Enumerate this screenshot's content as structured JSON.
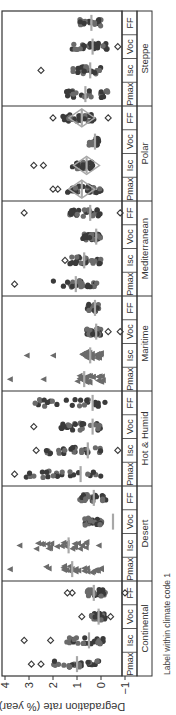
{
  "chart_data": {
    "type": "scatter",
    "title": "",
    "ylabel": "Degradation rate (% year)",
    "xlabel": "Label within climate code 1",
    "ylim": [
      -1,
      4
    ],
    "yticks": [
      -1,
      0,
      1,
      2,
      3,
      4
    ],
    "parameters": [
      "Pmax",
      "Isc",
      "Voc",
      "FF"
    ],
    "climates": [
      "Continental",
      "Desert",
      "Hot & Humid",
      "Maritime",
      "Mediterranean",
      "Polar",
      "Steppe"
    ],
    "groups": [
      {
        "climate": "Continental",
        "param": "Pmax",
        "median": 1.0,
        "range": [
          0.0,
          2.0
        ],
        "outliers": [
          2.5,
          2.9
        ]
      },
      {
        "climate": "Continental",
        "param": "Isc",
        "median": 0.5,
        "range": [
          -0.1,
          1.6
        ],
        "outliers": [
          2.1,
          3.2
        ]
      },
      {
        "climate": "Continental",
        "param": "Voc",
        "median": 0.1,
        "range": [
          -0.2,
          0.4
        ],
        "outliers": [
          -0.4,
          0.8
        ]
      },
      {
        "climate": "Continental",
        "param": "FF",
        "median": 0.3,
        "range": [
          -0.2,
          0.6
        ],
        "outliers": [
          1.2,
          1.4,
          -1.0
        ]
      },
      {
        "climate": "Desert",
        "param": "Pmax",
        "median": 1.2,
        "range": [
          0.0,
          2.3
        ],
        "outliers": [
          3.8
        ]
      },
      {
        "climate": "Desert",
        "param": "Isc",
        "median": 1.35,
        "range": [
          0.6,
          2.7
        ],
        "outliers": [
          3.4,
          0.1
        ]
      },
      {
        "climate": "Desert",
        "param": "Voc",
        "median": -0.5,
        "range": [
          -0.1,
          0.7
        ],
        "outliers": []
      },
      {
        "climate": "Desert",
        "param": "FF",
        "median": 0.3,
        "range": [
          -0.2,
          0.9
        ],
        "outliers": []
      },
      {
        "climate": "Hot & Humid",
        "param": "Pmax",
        "median": 0.85,
        "range": [
          0.0,
          3.2
        ],
        "outliers": [
          3.6
        ]
      },
      {
        "climate": "Hot & Humid",
        "param": "Isc",
        "median": 0.55,
        "range": [
          0.0,
          2.3
        ],
        "outliers": [
          2.7,
          -0.7
        ]
      },
      {
        "climate": "Hot & Humid",
        "param": "Voc",
        "median": 0.35,
        "range": [
          0.0,
          1.7
        ],
        "outliers": [
          2.8
        ]
      },
      {
        "climate": "Hot & Humid",
        "param": "FF",
        "median": 0.35,
        "range": [
          -0.2,
          2.8
        ],
        "outliers": []
      },
      {
        "climate": "Maritime",
        "param": "Pmax",
        "median": 0.7,
        "range": [
          -0.1,
          1.1
        ],
        "outliers": [
          2.4,
          3.8
        ]
      },
      {
        "climate": "Maritime",
        "param": "Isc",
        "median": 0.45,
        "range": [
          0.0,
          0.8
        ],
        "outliers": [
          2.0,
          3.1
        ]
      },
      {
        "climate": "Maritime",
        "param": "Voc",
        "median": 0.2,
        "range": [
          0.0,
          0.6
        ],
        "outliers": [
          -0.3,
          -0.8
        ]
      },
      {
        "climate": "Maritime",
        "param": "FF",
        "median": 0.25,
        "range": [
          0.1,
          0.6
        ],
        "outliers": []
      },
      {
        "climate": "Mediterranean",
        "param": "Pmax",
        "median": 1.05,
        "range": [
          0.0,
          2.0
        ],
        "outliers": [
          3.6
        ]
      },
      {
        "climate": "Mediterranean",
        "param": "Isc",
        "median": 0.7,
        "range": [
          0.0,
          1.3
        ],
        "outliers": [
          1.5
        ]
      },
      {
        "climate": "Mediterranean",
        "param": "Voc",
        "median": 0.2,
        "range": [
          0.0,
          0.8
        ],
        "outliers": []
      },
      {
        "climate": "Mediterranean",
        "param": "FF",
        "median": 0.45,
        "range": [
          0.0,
          1.3
        ],
        "outliers": [
          3.2,
          -0.8
        ]
      },
      {
        "climate": "Polar",
        "param": "Pmax",
        "median": 0.8,
        "range": [
          0.0,
          1.5
        ],
        "outliers": [
          1.8,
          2.0
        ]
      },
      {
        "climate": "Polar",
        "param": "Isc",
        "median": 0.6,
        "range": [
          0.3,
          1.2
        ],
        "outliers": [
          2.4,
          2.8
        ]
      },
      {
        "climate": "Polar",
        "param": "Voc",
        "median": 0.25,
        "range": [
          0.1,
          0.5
        ],
        "outliers": []
      },
      {
        "climate": "Polar",
        "param": "FF",
        "median": 0.8,
        "range": [
          0.1,
          1.6
        ],
        "outliers": [
          2.0,
          -0.3
        ]
      },
      {
        "climate": "Steppe",
        "param": "Pmax",
        "median": 0.65,
        "range": [
          -0.3,
          1.5
        ],
        "outliers": []
      },
      {
        "climate": "Steppe",
        "param": "Isc",
        "median": 0.45,
        "range": [
          0.0,
          1.2
        ],
        "outliers": [
          2.5
        ]
      },
      {
        "climate": "Steppe",
        "param": "Voc",
        "median": 0.35,
        "range": [
          -0.3,
          1.2
        ],
        "outliers": [
          -0.7
        ]
      },
      {
        "climate": "Steppe",
        "param": "FF",
        "median": 0.4,
        "range": [
          0.0,
          0.9
        ],
        "outliers": []
      }
    ],
    "grid": false,
    "orientation_note": "figure rotated 90 degrees counter-clockwise"
  },
  "labels": {
    "ylabel": "Degradation rate (% year)",
    "footnote": "Label within climate code 1",
    "ticks": [
      "−1",
      "0",
      "1",
      "2",
      "3",
      "4"
    ]
  },
  "colors": {
    "marker_dark": "#3a3a3a",
    "marker_mid": "#6b6b6b",
    "median_bar": "#a8a8a8",
    "frame": "#333333"
  }
}
